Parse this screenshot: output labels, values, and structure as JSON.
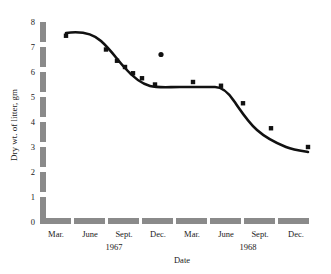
{
  "chart_data": {
    "type": "line",
    "title": "",
    "subtitle": "",
    "xlabel": "Date",
    "ylabel": "Dry wt. of litter, gm",
    "ylim": [
      0,
      8
    ],
    "yticks": [
      0,
      1,
      2,
      3,
      4,
      5,
      6,
      7,
      8
    ],
    "ytick_labels": [
      "0",
      "1",
      "2",
      "3",
      "4",
      "5",
      "6",
      "7",
      "8"
    ],
    "grid": false,
    "legend": "none",
    "xtick_labels": [
      "Mar.",
      "June",
      "Sept.",
      "Dec.",
      "Mar.",
      "June",
      "Sept.",
      "Dec."
    ],
    "group_labels": [
      "1967",
      "1968"
    ],
    "x": [
      "Mar. 1967",
      "June 1967",
      "Sept. 1967",
      "Dec. 1967",
      "Mar. 1968",
      "June 1968",
      "Sept. 1968",
      "Dec. 1968"
    ],
    "series": [
      {
        "name": "Dry wt. of litter",
        "marker": "square",
        "color": "#111111",
        "points": [
          {
            "x": "Mar. 1967",
            "x_px": 66,
            "value": 7.45
          },
          {
            "x": "Jun. 1967 early",
            "x_px": 106,
            "value": 6.9
          },
          {
            "x": "June 1967",
            "x_px": 117,
            "value": 6.45
          },
          {
            "x": "Jul. 1967",
            "x_px": 125,
            "value": 6.2
          },
          {
            "x": "Aug. 1967",
            "x_px": 133,
            "value": 5.95
          },
          {
            "x": "Sept. 1967",
            "x_px": 142,
            "value": 5.75
          },
          {
            "x": "Nov. 1967",
            "x_px": 155,
            "value": 5.5
          },
          {
            "x": "Mar. 1968",
            "x_px": 193,
            "value": 5.6
          },
          {
            "x": "June 1968",
            "x_px": 221,
            "value": 5.45
          },
          {
            "x": "Jul. 1968",
            "x_px": 243,
            "value": 4.75
          },
          {
            "x": "Sept. 1968",
            "x_px": 271,
            "value": 3.75
          },
          {
            "x": "Dec. 1968",
            "x_px": 308,
            "value": 3.0
          }
        ]
      },
      {
        "name": "Outlier observation",
        "marker": "dot",
        "color": "#111111",
        "points": [
          {
            "x": "Dec. 1967",
            "x_px": 161,
            "value": 6.7
          }
        ]
      }
    ],
    "fitted_curve_note": "smooth sigmoid-like fitted curve through data",
    "colors": {
      "axis": "#8a8a8a",
      "curve": "#111111",
      "marker": "#111111",
      "text": "#1a1a1a",
      "background": "#ffffff"
    }
  }
}
